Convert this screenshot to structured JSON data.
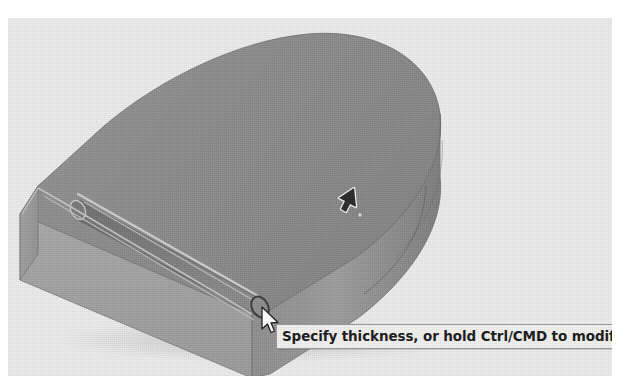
{
  "app": {
    "viewport_background": "#ededed",
    "type": "cad-3d-viewport"
  },
  "model": {
    "name": "d-shaped-extruded-solid",
    "description": "Extruded D-shaped plate with a rounded slot groove along the front-left edge",
    "faces": {
      "top_face_color": "#8d8d8d",
      "front_face_color": "#a0a0a0",
      "left_chamfer_color": "#9a9a9a",
      "right_cylindrical_face_color": "#8a8a8a",
      "groove_color": "#7a7a7a",
      "highlight_edge_color": "#d8d8d8"
    },
    "features": [
      {
        "name": "rounded-groove",
        "label": "Groove"
      },
      {
        "name": "rounded-end-cap",
        "label": "End cap"
      },
      {
        "name": "cylindrical-side",
        "label": "Cylindrical face"
      }
    ]
  },
  "cursors": {
    "select_arrow": {
      "name": "select-arrow-cursor",
      "icon": "arrow-cursor-icon"
    },
    "mouse_pointer": {
      "name": "mouse-pointer-cursor",
      "icon": "pointer-icon"
    }
  },
  "tooltip": {
    "text": "Specify thickness, or hold Ctrl/CMD to modify selections",
    "background": "#f2f2f0",
    "border_color": "#9a9a9a",
    "text_color": "#1a1a1a"
  }
}
